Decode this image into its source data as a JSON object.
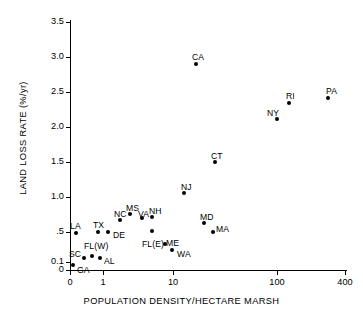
{
  "chart_data": {
    "type": "scatter",
    "title": "",
    "xlabel": "POPULATION DENSITY/HECTARE MARSH",
    "ylabel": "LAND LOSS RATE (%/yr)",
    "xscale": "log",
    "yscale": "linear-with-compressed-origin",
    "xticklabels": [
      "0",
      "1",
      "10",
      "100",
      "400"
    ],
    "yticklabels": [
      "0",
      "0.1",
      ".5",
      "1.0",
      "1.5",
      "2.0",
      "2.5",
      "3.0",
      "3.5"
    ],
    "xlim": [
      0,
      400
    ],
    "ylim": [
      0,
      3.5
    ],
    "grid": false,
    "legend": "none",
    "marker": "filled-circle",
    "points": [
      {
        "label": "GA",
        "x": 0.1,
        "y": 0.07,
        "px": 73,
        "py": 265,
        "lx": 77,
        "ly": 265
      },
      {
        "label": "SC",
        "x": 0.35,
        "y": 0.15,
        "px": 84,
        "py": 258,
        "lx": 69,
        "ly": 249
      },
      {
        "label": "LA",
        "x": 0.14,
        "y": 0.46,
        "px": 76,
        "py": 233,
        "lx": 70,
        "ly": 221
      },
      {
        "label": "FL(W)",
        "x": 0.55,
        "y": 0.17,
        "px": 92,
        "py": 256,
        "lx": 84,
        "ly": 241
      },
      {
        "label": "AL",
        "x": 0.8,
        "y": 0.15,
        "px": 100,
        "py": 258,
        "lx": 104,
        "ly": 256
      },
      {
        "label": "TX",
        "x": 0.72,
        "y": 0.47,
        "px": 98,
        "py": 232,
        "lx": 93,
        "ly": 220
      },
      {
        "label": "DE",
        "x": 1.15,
        "y": 0.47,
        "px": 108,
        "py": 232,
        "lx": 113,
        "ly": 230
      },
      {
        "label": "NC",
        "x": 1.7,
        "y": 0.64,
        "px": 120,
        "py": 220,
        "lx": 114,
        "ly": 209
      },
      {
        "label": "MS",
        "x": 2.45,
        "y": 0.72,
        "px": 130,
        "py": 214,
        "lx": 126,
        "ly": 203
      },
      {
        "label": "VA",
        "x": 3.6,
        "y": 0.66,
        "px": 142,
        "py": 218,
        "lx": 138,
        "ly": 209
      },
      {
        "label": "NH",
        "x": 5.0,
        "y": 0.68,
        "px": 152,
        "py": 217,
        "lx": 149,
        "ly": 206
      },
      {
        "label": "FL(E)",
        "x": 5.0,
        "y": 0.48,
        "px": 152,
        "py": 231,
        "lx": 142,
        "ly": 239
      },
      {
        "label": "ME",
        "x": 7.8,
        "y": 0.3,
        "px": 165,
        "py": 244,
        "lx": 166,
        "ly": 238
      },
      {
        "label": "WA",
        "x": 9.8,
        "y": 0.2,
        "px": 172,
        "py": 250,
        "lx": 177,
        "ly": 249
      },
      {
        "label": "NJ",
        "x": 13.0,
        "y": 1.05,
        "px": 184,
        "py": 193,
        "lx": 181,
        "ly": 182
      },
      {
        "label": "CA",
        "x": 19.0,
        "y": 2.95,
        "px": 196,
        "py": 64,
        "lx": 192,
        "ly": 52
      },
      {
        "label": "CT",
        "x": 20.5,
        "y": 1.52,
        "px": 215,
        "py": 162,
        "lx": 211,
        "ly": 151
      },
      {
        "label": "MD",
        "x": 23.0,
        "y": 0.6,
        "px": 204,
        "py": 223,
        "lx": 200,
        "ly": 212
      },
      {
        "label": "MA",
        "x": 27.0,
        "y": 0.47,
        "px": 213,
        "py": 232,
        "lx": 216,
        "ly": 224
      },
      {
        "label": "NY",
        "x": 103,
        "y": 2.1,
        "px": 277,
        "py": 119,
        "lx": 267,
        "ly": 108
      },
      {
        "label": "RI",
        "x": 148,
        "y": 2.34,
        "px": 289,
        "py": 103,
        "lx": 286,
        "ly": 91
      },
      {
        "label": "PA",
        "x": 310,
        "y": 2.41,
        "px": 328,
        "py": 98,
        "lx": 326,
        "ly": 86
      }
    ],
    "yticks": [
      {
        "label": "3.5",
        "py": 22
      },
      {
        "label": "3.0",
        "py": 57
      },
      {
        "label": "2.5",
        "py": 92
      },
      {
        "label": "2.0",
        "py": 127
      },
      {
        "label": "1.5",
        "py": 162
      },
      {
        "label": "1.0",
        "py": 197
      },
      {
        "label": ".5",
        "py": 232
      },
      {
        "label": "0.1",
        "py": 262
      },
      {
        "label": "0",
        "py": 270
      }
    ],
    "xticks": [
      {
        "label": "0",
        "px": 70
      },
      {
        "label": "1",
        "px": 103
      },
      {
        "label": "10",
        "px": 173
      },
      {
        "label": "100",
        "px": 277
      },
      {
        "label": "400",
        "px": 345
      }
    ]
  }
}
